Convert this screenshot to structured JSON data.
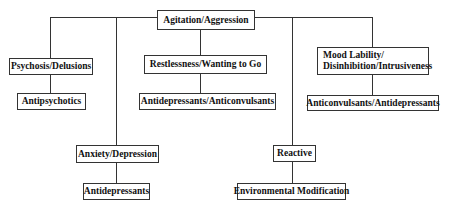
{
  "diagram": {
    "type": "tree",
    "root": {
      "label": "Agitation/Aggression"
    },
    "branches": [
      {
        "symptom": "Psychosis/Delusions",
        "treatment": "Antipsychotics"
      },
      {
        "symptom": "Anxiety/Depression",
        "treatment": "Antidepressants"
      },
      {
        "symptom": "Restlessness/Wanting to Go",
        "treatment": "Antidepressants/Anticonvulsants"
      },
      {
        "symptom": "Reactive",
        "treatment": "Environmental Modification"
      },
      {
        "symptom_line1": "Mood Lability/",
        "symptom_line2": "Disinhibition/Intrusiveness",
        "treatment": "Anticonvulsants/Antidepressants"
      }
    ]
  },
  "colors": {
    "line": "#333333",
    "box_border": "#333333",
    "text": "#111111",
    "background": "#ffffff"
  }
}
